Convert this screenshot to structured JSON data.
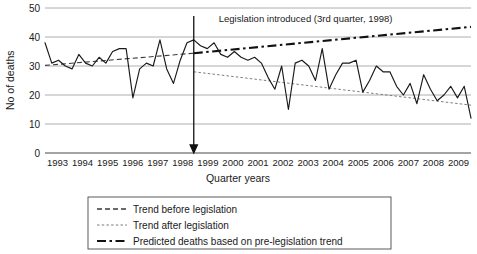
{
  "chart_data": {
    "type": "line",
    "title": "",
    "xlabel": "Quarter years",
    "ylabel": "No of deaths",
    "ylim": [
      0,
      50
    ],
    "yticks": [
      0,
      10,
      20,
      30,
      40,
      50
    ],
    "grid": true,
    "legend_position": "below",
    "x_tick_labels": [
      "1993",
      "1994",
      "1995",
      "1996",
      "1997",
      "1998",
      "1999",
      "2000",
      "2001",
      "2002",
      "2003",
      "2004",
      "2005",
      "2006",
      "2007",
      "2008",
      "2009"
    ],
    "x_start_year": 1993,
    "x_end_year": 2009,
    "quarters_per_year": 4,
    "annotations": [
      {
        "name": "legislation-marker",
        "text": "Legislation introduced (3rd quarter, 1998)",
        "at_year": 1998,
        "at_quarter": 3,
        "marker": "vertical-arrow"
      }
    ],
    "series": [
      {
        "name": "Observed deaths",
        "style": "solid",
        "values": [
          38,
          31,
          32,
          30,
          29,
          34,
          31,
          30,
          33,
          31,
          35,
          36,
          36,
          19,
          29,
          31,
          30,
          39,
          29,
          24,
          32,
          38,
          39,
          37,
          36,
          38,
          34,
          33,
          35,
          33,
          32,
          33,
          31,
          26,
          22,
          30,
          15,
          31,
          32,
          30,
          25,
          36,
          22,
          27,
          31,
          31,
          32,
          21,
          25,
          30,
          28,
          28,
          23,
          20,
          24,
          17,
          27,
          22,
          18,
          20,
          23,
          19,
          23,
          12
        ]
      },
      {
        "name": "Trend before legislation",
        "style": "dashed",
        "segment": "pre",
        "y_start": 30.2,
        "y_end": 34.4
      },
      {
        "name": "Trend after legislation",
        "style": "dotted",
        "segment": "post",
        "y_start": 28.0,
        "y_end": 16.5
      },
      {
        "name": "Predicted deaths based on pre-legislation trend",
        "style": "dash-dot",
        "segment": "post",
        "y_start": 34.4,
        "y_end": 43.5
      }
    ]
  },
  "legend": {
    "items": [
      {
        "label": "Trend before legislation",
        "style": "dashed"
      },
      {
        "label": "Trend after legislation",
        "style": "dotted"
      },
      {
        "label": "Predicted deaths based on pre-legislation trend",
        "style": "dash-dot"
      }
    ]
  },
  "axes": {
    "y_title": "No of deaths",
    "x_title": "Quarter years",
    "y_tick_0": "0",
    "y_tick_10": "10",
    "y_tick_20": "20",
    "y_tick_30": "30",
    "y_tick_40": "40",
    "y_tick_50": "50"
  }
}
